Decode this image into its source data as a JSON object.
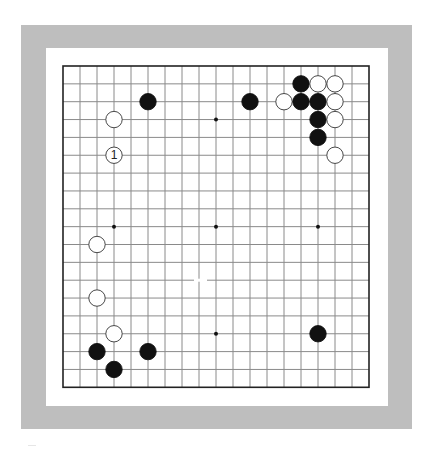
{
  "diagram": {
    "type": "go-board",
    "size": 19,
    "frame_color": "#bebebe",
    "board_color": "#ffffff",
    "line_color": "#8a8a8a",
    "border_color": "#222222",
    "star_points": [
      [
        3,
        3
      ],
      [
        9,
        3
      ],
      [
        15,
        3
      ],
      [
        3,
        9
      ],
      [
        9,
        9
      ],
      [
        15,
        9
      ],
      [
        3,
        15
      ],
      [
        9,
        15
      ],
      [
        15,
        15
      ]
    ],
    "stones": [
      {
        "color": "black",
        "col": 14,
        "row": 1
      },
      {
        "color": "white",
        "col": 15,
        "row": 1
      },
      {
        "color": "white",
        "col": 16,
        "row": 1
      },
      {
        "color": "black",
        "col": 5,
        "row": 2
      },
      {
        "color": "black",
        "col": 11,
        "row": 2
      },
      {
        "color": "white",
        "col": 13,
        "row": 2
      },
      {
        "color": "black",
        "col": 14,
        "row": 2
      },
      {
        "color": "black",
        "col": 15,
        "row": 2
      },
      {
        "color": "white",
        "col": 16,
        "row": 2
      },
      {
        "color": "white",
        "col": 3,
        "row": 3
      },
      {
        "color": "black",
        "col": 15,
        "row": 3
      },
      {
        "color": "white",
        "col": 16,
        "row": 3
      },
      {
        "color": "black",
        "col": 15,
        "row": 4
      },
      {
        "color": "white",
        "col": 3,
        "row": 5,
        "label": "1"
      },
      {
        "color": "white",
        "col": 16,
        "row": 5
      },
      {
        "color": "white",
        "col": 2,
        "row": 10
      },
      {
        "color": "white",
        "col": 2,
        "row": 13
      },
      {
        "color": "white",
        "col": 3,
        "row": 15
      },
      {
        "color": "black",
        "col": 15,
        "row": 15
      },
      {
        "color": "black",
        "col": 2,
        "row": 16
      },
      {
        "color": "black",
        "col": 5,
        "row": 16
      },
      {
        "color": "black",
        "col": 3,
        "row": 17
      }
    ],
    "move_label": "1"
  }
}
